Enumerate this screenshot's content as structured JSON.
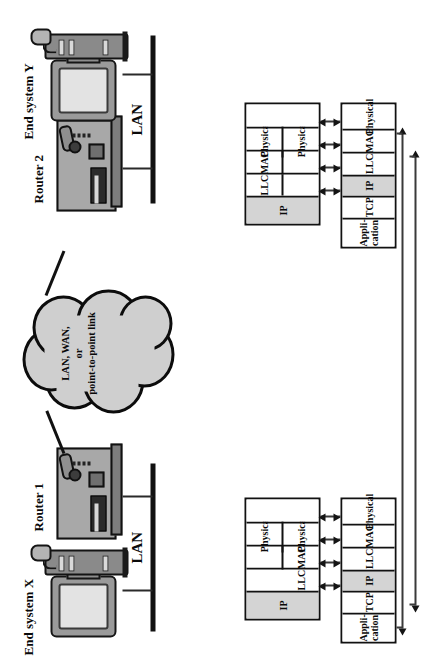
{
  "figure": {
    "orientation": "rotated-90",
    "shade_color": "#d4d4d4",
    "line_color": "#111111"
  },
  "topology": {
    "nodes": [
      {
        "id": "end-system-x",
        "label": "End system X",
        "type": "workstation"
      },
      {
        "id": "router-1",
        "label": "Router 1",
        "type": "router"
      },
      {
        "id": "cloud",
        "label": "LAN, WAN, or point-to-point link",
        "type": "cloud"
      },
      {
        "id": "router-2",
        "label": "Router 2",
        "type": "router"
      },
      {
        "id": "end-system-y",
        "label": "End system Y",
        "type": "workstation"
      }
    ],
    "cloud_lines": [
      "LAN, WAN,",
      "or",
      "point-to-point link"
    ],
    "lan_left_label": "LAN",
    "lan_right_label": "LAN"
  },
  "stacks": {
    "end_system_x": {
      "name": "End system X protocol stack",
      "layers": [
        {
          "label": "Appli-\ncation",
          "line1": "Appli-",
          "line2": "cation",
          "shaded": false
        },
        {
          "label": "TCP",
          "shaded": false
        },
        {
          "label": "IP",
          "shaded": true
        },
        {
          "label": "LLC",
          "shaded": false
        },
        {
          "label": "MAC",
          "shaded": false
        },
        {
          "label": "Physical",
          "shaded": false
        }
      ]
    },
    "end_system_y": {
      "name": "End system Y protocol stack",
      "layers": [
        {
          "label": "Appli-\ncation",
          "line1": "Appli-",
          "line2": "cation",
          "shaded": false
        },
        {
          "label": "TCP",
          "shaded": false
        },
        {
          "label": "IP",
          "shaded": true
        },
        {
          "label": "LLC",
          "shaded": false
        },
        {
          "label": "MAC",
          "shaded": false
        },
        {
          "label": "Physical",
          "shaded": false
        }
      ]
    },
    "router_1": {
      "name": "Router 1 protocol stack",
      "ip_label": "IP",
      "ip_shaded": true,
      "near_side": {
        "llc": "LLC",
        "mac": "MAC",
        "physical": "Physical"
      },
      "far_side": {
        "blank": "",
        "physical": "Physical"
      }
    },
    "router_2": {
      "name": "Router 2 protocol stack",
      "ip_label": "IP",
      "ip_shaded": true,
      "near_side": {
        "llc": "LLC",
        "mac": "MAC",
        "physical": "Physical"
      },
      "far_side": {
        "blank": "",
        "physical": "Physical"
      }
    },
    "peer_arrows": [
      {
        "id": "application-peer-arrow",
        "from": "end-system-x.application",
        "to": "end-system-y.application",
        "double_headed": true
      },
      {
        "id": "tcp-peer-arrow",
        "from": "end-system-x.tcp",
        "to": "end-system-y.tcp",
        "double_headed": true
      },
      {
        "id": "ip-hop-arrow-x-r1",
        "from": "end-system-x.ip",
        "to": "router-1.ip",
        "double_headed": true
      },
      {
        "id": "llc-hop-arrow-x-r1",
        "from": "end-system-x.llc",
        "to": "router-1.llc",
        "double_headed": true
      },
      {
        "id": "mac-hop-arrow-x-r1",
        "from": "end-system-x.mac",
        "to": "router-1.mac",
        "double_headed": true
      },
      {
        "id": "phy-hop-arrow-x-r1",
        "from": "end-system-x.physical",
        "to": "router-1.physical",
        "double_headed": true
      },
      {
        "id": "ip-hop-arrow-r2-y",
        "from": "router-2.ip",
        "to": "end-system-y.ip",
        "double_headed": true
      },
      {
        "id": "llc-hop-arrow-r2-y",
        "from": "router-2.llc",
        "to": "end-system-y.llc",
        "double_headed": true
      },
      {
        "id": "mac-hop-arrow-r2-y",
        "from": "router-2.mac",
        "to": "end-system-y.mac",
        "double_headed": true
      },
      {
        "id": "phy-hop-arrow-r2-y",
        "from": "router-2.physical",
        "to": "end-system-y.physical",
        "double_headed": true
      }
    ]
  }
}
